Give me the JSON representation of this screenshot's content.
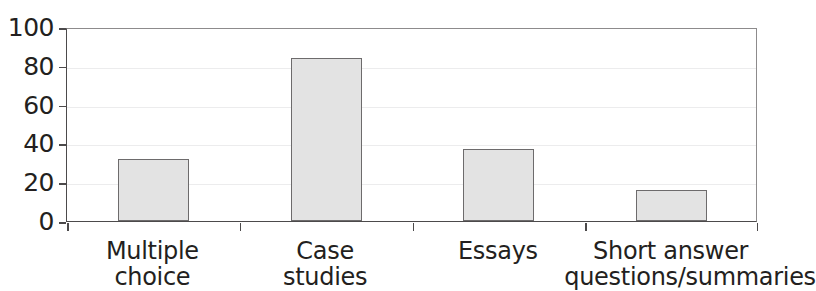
{
  "chart_data": {
    "type": "bar",
    "title": "",
    "xlabel": "",
    "ylabel": "",
    "ylim": [
      0,
      100
    ],
    "yticks": [
      0,
      20,
      40,
      60,
      80,
      100
    ],
    "grid": true,
    "legend": null,
    "categories": [
      "Multiple choice",
      "Case studies",
      "Essays",
      "Short answer questions/summaries"
    ],
    "category_lines": [
      [
        "Multiple",
        "choice"
      ],
      [
        "Case",
        "studies"
      ],
      [
        "Essays"
      ],
      [
        "Short answer",
        "questions/summaries"
      ]
    ],
    "values": [
      32,
      84,
      37,
      16
    ],
    "bar_color": "#e3e3e3",
    "bar_edge_color": "#6d6b6c",
    "axis_color": "#4c4a4b",
    "text_color": "#231f20"
  },
  "axis": {
    "y_labels": [
      "100",
      "80",
      "60",
      "40",
      "20",
      "0"
    ]
  }
}
